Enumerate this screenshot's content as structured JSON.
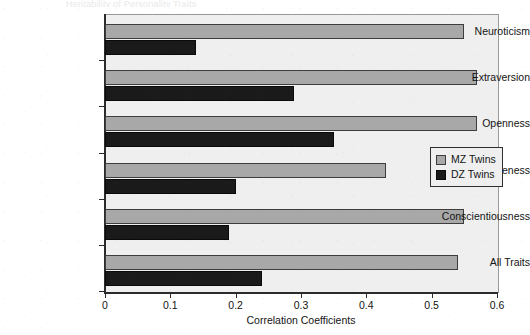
{
  "figure": {
    "title_sliver": "Heritability of Personality Traits",
    "background_color": "#ffffff",
    "plot_background_color": "#efefef"
  },
  "axis": {
    "x_title": "Correlation Coefficients",
    "x_ticks": [
      "0",
      "0.1",
      "0.2",
      "0.3",
      "0.4",
      "0.5",
      "0.6"
    ],
    "x_min": 0,
    "x_max": 0.6
  },
  "legend": {
    "position": "middle-right",
    "entries": [
      {
        "label": "MZ Twins",
        "color": "#a8a8a8"
      },
      {
        "label": "DZ Twins",
        "color": "#1a1a1a"
      }
    ]
  },
  "chart_data": {
    "type": "bar",
    "orientation": "horizontal",
    "title": "",
    "xlabel": "Correlation Coefficients",
    "ylabel": "",
    "xlim": [
      0,
      0.6
    ],
    "grid": false,
    "legend_position": "middle-right",
    "categories": [
      "Neuroticism",
      "Extraversion",
      "Openness",
      "Agreeableness",
      "Conscientiousness",
      "All Traits"
    ],
    "series": [
      {
        "name": "MZ Twins",
        "color": "#a8a8a8",
        "values": [
          0.55,
          0.57,
          0.57,
          0.43,
          0.55,
          0.54
        ]
      },
      {
        "name": "DZ Twins",
        "color": "#1a1a1a",
        "values": [
          0.14,
          0.29,
          0.35,
          0.2,
          0.19,
          0.24
        ]
      }
    ]
  }
}
